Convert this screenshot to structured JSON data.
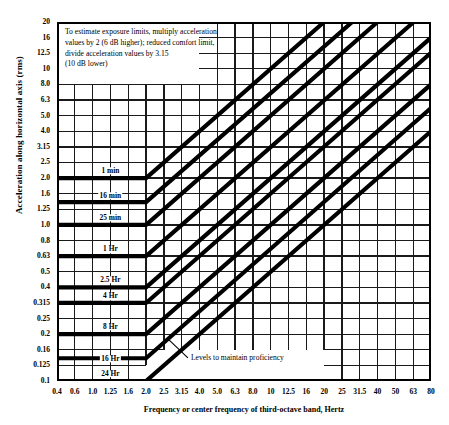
{
  "chart_data": {
    "type": "line",
    "title": "",
    "xlabel": "Frequency or center frequency of third-octave band, Hertz",
    "ylabel": "Acceleration along horizontal axis  (rms)",
    "xscale": "log",
    "yscale": "log",
    "xlim": [
      0.4,
      80
    ],
    "ylim": [
      0.1,
      20
    ],
    "grid": true,
    "legend_position": "none",
    "xticks": [
      "0.4",
      "0.6",
      "1.0",
      "1.25",
      "1.6",
      "2.0",
      "2.5",
      "3.15",
      "4.0",
      "5.0",
      "6.3",
      "8.0",
      "10",
      "12.5",
      "16",
      "20",
      "25",
      "31.5",
      "40",
      "50",
      "63",
      "80"
    ],
    "xtick_values": [
      0.4,
      0.6,
      1.0,
      1.25,
      1.6,
      2.0,
      2.5,
      3.15,
      4.0,
      5.0,
      6.3,
      8.0,
      10,
      12.5,
      16,
      20,
      25,
      31.5,
      40,
      50,
      63,
      80
    ],
    "yticks": [
      "20",
      "16",
      "12.5",
      "10",
      "8.0",
      "6.3",
      "5.0",
      "4.0",
      "3.15",
      "2.5",
      "2.0",
      "1.6",
      "1.25",
      "1.0",
      "0.8",
      "0.63",
      "0.5",
      "0.4",
      "0.315",
      "0.25",
      "0.2",
      "0.16",
      "0.125",
      "0.1"
    ],
    "ytick_values": [
      20,
      16,
      12.5,
      10,
      8.0,
      6.3,
      5.0,
      4.0,
      3.15,
      2.5,
      2.0,
      1.6,
      1.25,
      1.0,
      0.8,
      0.63,
      0.5,
      0.4,
      0.315,
      0.25,
      0.2,
      0.16,
      0.125,
      0.1
    ],
    "series_description": "Levels to maintain proficiency (fatigue-decreased proficiency boundary) for horizontal-axis whole-body vibration; each curve is constant acceleration from 0.4 to 2.0 Hz then rises proportional to frequency above 2.0 Hz.",
    "series": [
      {
        "name": "1 min",
        "plateau_accel": 2.0,
        "break_frequency": 2.0,
        "accel_at_80hz": 20.0
      },
      {
        "name": "16 min",
        "plateau_accel": 1.4,
        "break_frequency": 2.0,
        "accel_at_80hz": 20.0
      },
      {
        "name": "25 min",
        "plateau_accel": 1.0,
        "break_frequency": 2.0,
        "accel_at_80hz": 20.0
      },
      {
        "name": "1 Hr",
        "plateau_accel": 0.63,
        "break_frequency": 2.0,
        "accel_at_80hz": 20.0
      },
      {
        "name": "2.5 Hr",
        "plateau_accel": 0.4,
        "break_frequency": 2.0,
        "accel_at_80hz": 16.0
      },
      {
        "name": "4 Hr",
        "plateau_accel": 0.315,
        "break_frequency": 2.0,
        "accel_at_80hz": 12.5
      },
      {
        "name": "8 Hr",
        "plateau_accel": 0.2,
        "break_frequency": 2.0,
        "accel_at_80hz": 8.0
      },
      {
        "name": "16 Hr",
        "plateau_accel": 0.14,
        "break_frequency": 2.0,
        "accel_at_80hz": 5.6
      },
      {
        "name": "24 Hr",
        "plateau_accel": 0.1,
        "break_frequency": 2.0,
        "accel_at_80hz": 4.0
      }
    ],
    "curve_labels": [
      {
        "text": "1 min",
        "freq": 1.25,
        "accel": 2.22
      },
      {
        "text": "16 min",
        "freq": 1.25,
        "accel": 1.55
      },
      {
        "text": "25 min",
        "freq": 1.25,
        "accel": 1.11
      },
      {
        "text": "1 Hr",
        "freq": 1.25,
        "accel": 0.7
      },
      {
        "text": "2.5 Hr",
        "freq": 1.25,
        "accel": 0.445
      },
      {
        "text": "4 Hr",
        "freq": 1.25,
        "accel": 0.35
      },
      {
        "text": "8 Hr",
        "freq": 1.25,
        "accel": 0.222
      },
      {
        "text": "16 Hr",
        "freq": 1.25,
        "accel": 0.1385
      },
      {
        "text": "24 Hr",
        "freq": 1.25,
        "accel": 0.111
      }
    ],
    "annotations": [
      {
        "name": "estimate-note",
        "lines": [
          "To estimate exposure limits, multiply acceleration",
          "values by 2 (6 dB higher); reduced comfort limit,",
          "divide acceleration values by 3.15",
          "(10 dB lower)"
        ]
      },
      {
        "name": "proficiency-callout",
        "text": "Levels to maintain proficiency",
        "points_to_freq": 2.6,
        "points_to_accel": 0.155
      }
    ],
    "colors": {
      "curve": "#000000",
      "grid": "#1a1a1a",
      "axis": "#000000",
      "background": "#ffffff"
    }
  }
}
